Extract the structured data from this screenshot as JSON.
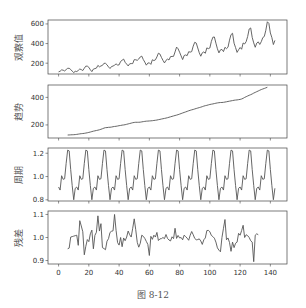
{
  "figure": {
    "caption": "图 8-12"
  },
  "chart_data": [
    {
      "type": "line",
      "title": "",
      "ylabel": "观察值",
      "xlabel": "",
      "ylim": [
        90,
        640
      ],
      "yticks": [
        200,
        400,
        600
      ],
      "xlim": [
        -7,
        151
      ],
      "series": [
        {
          "name": "observed",
          "color": "#555555",
          "values": [
            112,
            118,
            132,
            129,
            121,
            135,
            148,
            148,
            136,
            119,
            104,
            118,
            115,
            126,
            141,
            135,
            125,
            149,
            170,
            170,
            158,
            133,
            114,
            140,
            145,
            150,
            178,
            163,
            172,
            178,
            199,
            199,
            184,
            162,
            146,
            166,
            171,
            180,
            193,
            181,
            183,
            218,
            230,
            242,
            209,
            191,
            172,
            194,
            196,
            196,
            236,
            235,
            229,
            243,
            264,
            272,
            237,
            211,
            180,
            201,
            204,
            188,
            235,
            227,
            234,
            264,
            302,
            293,
            259,
            229,
            203,
            229,
            242,
            233,
            267,
            269,
            270,
            315,
            364,
            347,
            312,
            274,
            237,
            278,
            284,
            277,
            317,
            313,
            318,
            374,
            413,
            405,
            355,
            306,
            271,
            306,
            315,
            301,
            356,
            348,
            355,
            422,
            465,
            467,
            404,
            347,
            305,
            336,
            340,
            318,
            362,
            348,
            363,
            435,
            491,
            505,
            404,
            359,
            310,
            337,
            360,
            342,
            406,
            396,
            420,
            472,
            548,
            559,
            463,
            407,
            362,
            405,
            417,
            391,
            419,
            461,
            472,
            535,
            622,
            606,
            508,
            461,
            390,
            432
          ]
        }
      ]
    },
    {
      "type": "line",
      "ylabel": "趋势",
      "ylim": [
        105,
        490
      ],
      "yticks": [
        200,
        400
      ],
      "xlim": [
        -7,
        151
      ],
      "series": [
        {
          "name": "trend",
          "color": "#555555",
          "start_index": 6,
          "values": [
            126.8,
            127.2,
            127.96,
            128.58,
            129,
            129.75,
            131.25,
            133.08,
            134.92,
            136.42,
            137.42,
            138.75,
            140.92,
            143.17,
            145.71,
            148.42,
            151.54,
            154.71,
            157.12,
            159.54,
            161.83,
            164.75,
            168.29,
            172.46,
            176.83,
            180.08,
            180.62,
            182.58,
            183.12,
            184.54,
            186.88,
            188.83,
            190.08,
            192.08,
            194.46,
            196.25,
            198.42,
            199.75,
            201.79,
            204.5,
            207.38,
            210.21,
            212.92,
            216.04,
            218.04,
            219.17,
            219.12,
            219.29,
            220.04,
            222.04,
            224.04,
            225.67,
            227.29,
            227.83,
            228.88,
            229.71,
            230.71,
            232.38,
            233.75,
            235.5,
            238.08,
            240.21,
            242.75,
            245.04,
            247.21,
            249.67,
            252.54,
            255.75,
            259,
            262.17,
            265.29,
            268.42,
            271.25,
            274.67,
            278.54,
            282.5,
            286.79,
            290.62,
            294.42,
            298.42,
            302.83,
            306.25,
            309.54,
            312.33,
            315.96,
            319.5,
            322.62,
            325.71,
            329.04,
            332.62,
            336.71,
            339.75,
            342.25,
            345.29,
            348.46,
            350.58,
            352.62,
            355.12,
            357.75,
            359.83,
            361.46,
            362.75,
            362.92,
            364.04,
            366.08,
            368.08,
            370.54,
            372.62,
            374.58,
            376.83,
            379.21,
            380.67,
            381.62,
            383.58,
            385.33,
            388.38,
            393.25,
            399.79,
            404.96,
            410.21,
            415.25,
            419.71,
            424.92,
            431.33,
            436.08,
            441.67,
            446.58,
            452.04,
            456.96,
            461,
            464.83,
            469.21,
            473.5
          ]
        }
      ]
    },
    {
      "type": "line",
      "ylabel": "周期",
      "ylim": [
        0.79,
        1.245
      ],
      "yticks": [
        0.8,
        1.0,
        1.2
      ],
      "xlim": [
        -7,
        151
      ],
      "series": [
        {
          "name": "seasonal",
          "color": "#555555",
          "period": 12,
          "pattern": [
            0.91,
            0.884,
            1.007,
            0.976,
            0.981,
            1.113,
            1.227,
            1.22,
            1.06,
            0.922,
            0.801,
            0.899
          ]
        }
      ]
    },
    {
      "type": "line",
      "ylabel": "残差",
      "ylim": [
        0.885,
        1.115
      ],
      "yticks": [
        0.9,
        1.0,
        1.1
      ],
      "xlim": [
        -7,
        151
      ],
      "xticks": [
        0,
        20,
        40,
        60,
        80,
        100,
        120,
        140
      ],
      "series": [
        {
          "name": "residual",
          "color": "#555555",
          "start_index": 6,
          "values": [
            0.951,
            0.954,
            1.002,
            1.004,
            1.006,
            1.008,
            1.01,
            0.966,
            1.073,
            1.05,
            1.025,
            0.925,
            0.962,
            0.991,
            0.982,
            1.016,
            1.032,
            0.951,
            1.009,
            1.023,
            1.094,
            1.028,
            1.06,
            0.956,
            0.952,
            0.947,
            0.984,
            0.995,
            1.022,
            1.027,
            1.029,
            1.1,
            1.031,
            0.978,
            0.967,
            1.0,
            0.96,
            0.998,
            0.986,
            1.002,
            1.028,
            1.012,
            1.002,
            1.04,
            1.081,
            1.034,
            0.979,
            0.958,
            0.975,
            1.01,
            1.005,
            0.996,
            0.983,
            0.97,
            0.922,
            1.005,
            0.992,
            1.01,
            1.002,
            1.022,
            0.987,
            0.994,
            0.995,
            1.0,
            0.995,
            1.013,
            0.996,
            0.989,
            0.985,
            1.003,
            0.995,
            1.04,
            0.996,
            1.009,
            0.998,
            1.0,
            0.99,
            1.01,
            1.004,
            0.997,
            0.988,
            1.01,
            1.026,
            1.012,
            0.996,
            0.99,
            0.991,
            0.994,
            0.985,
            0.97,
            0.99,
            0.998,
            1.03,
            1.031,
            1.025,
            1.009,
            1.004,
            0.997,
            0.98,
            0.955,
            0.945,
            0.938,
            1.0,
            1.04,
            1.078,
            0.99,
            0.998,
            0.978,
            0.94,
            0.98,
            0.956,
            0.975,
            0.98,
            1.018,
            1.01,
            1.03,
            1.053,
            1.0,
            1.012,
            1.008,
            1.0,
            0.986,
            0.98,
            0.895,
            1.01,
            1.016,
            1.012
          ]
        }
      ]
    }
  ]
}
